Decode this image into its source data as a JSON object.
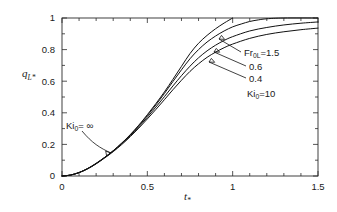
{
  "chart_data": {
    "type": "line",
    "title": "",
    "xlabel": "t*",
    "ylabel": "qL*",
    "xlim": [
      0,
      1.5
    ],
    "ylim": [
      0,
      1
    ],
    "grid": false,
    "legend_position": "inline-annotations",
    "x_ticks": [
      "0",
      "0.5",
      "1",
      "1.5"
    ],
    "x_tick_values": [
      0,
      0.5,
      1,
      1.5
    ],
    "x_minor_ticks": [
      0.1,
      0.2,
      0.3,
      0.4,
      0.6,
      0.7,
      0.8,
      0.9,
      1.1,
      1.2,
      1.3,
      1.4
    ],
    "y_ticks": [
      "0",
      "0.2",
      "0.4",
      "0.6",
      "0.8",
      "1"
    ],
    "y_tick_values": [
      0,
      0.2,
      0.4,
      0.6,
      0.8,
      1
    ],
    "y_minor_ticks": [
      0.1,
      0.3,
      0.5,
      0.7,
      0.9
    ],
    "series": [
      {
        "name": "Ki0=infinity",
        "label": "Ki",
        "label_sub": "0",
        "label_tail": "= ∞",
        "points": [
          [
            0.0,
            0.0
          ],
          [
            0.05,
            0.006
          ],
          [
            0.1,
            0.022
          ],
          [
            0.15,
            0.047
          ],
          [
            0.2,
            0.08
          ],
          [
            0.25,
            0.118
          ],
          [
            0.3,
            0.16
          ],
          [
            0.35,
            0.208
          ],
          [
            0.4,
            0.262
          ],
          [
            0.45,
            0.322
          ],
          [
            0.5,
            0.388
          ],
          [
            0.55,
            0.458
          ],
          [
            0.6,
            0.532
          ],
          [
            0.65,
            0.612
          ],
          [
            0.7,
            0.694
          ],
          [
            0.75,
            0.775
          ],
          [
            0.8,
            0.84
          ],
          [
            0.85,
            0.89
          ],
          [
            0.9,
            0.932
          ],
          [
            0.95,
            0.968
          ],
          [
            1.0,
            1.0
          ]
        ]
      },
      {
        "name": "Fr0L=1.5",
        "label": "Fr",
        "label_sub": "0L",
        "label_tail": "=1.5",
        "points": [
          [
            0.0,
            0.0
          ],
          [
            0.05,
            0.006
          ],
          [
            0.1,
            0.022
          ],
          [
            0.15,
            0.047
          ],
          [
            0.2,
            0.08
          ],
          [
            0.25,
            0.118
          ],
          [
            0.3,
            0.16
          ],
          [
            0.35,
            0.208
          ],
          [
            0.4,
            0.26
          ],
          [
            0.45,
            0.318
          ],
          [
            0.5,
            0.382
          ],
          [
            0.55,
            0.45
          ],
          [
            0.6,
            0.522
          ],
          [
            0.65,
            0.598
          ],
          [
            0.7,
            0.672
          ],
          [
            0.75,
            0.742
          ],
          [
            0.8,
            0.8
          ],
          [
            0.85,
            0.848
          ],
          [
            0.9,
            0.886
          ],
          [
            0.95,
            0.918
          ],
          [
            1.0,
            0.944
          ],
          [
            1.05,
            0.962
          ],
          [
            1.1,
            0.978
          ],
          [
            1.15,
            0.988
          ],
          [
            1.2,
            0.995
          ],
          [
            1.3,
            1.0
          ],
          [
            1.5,
            1.0
          ]
        ]
      },
      {
        "name": "0.6",
        "label": "0.6",
        "label_sub": "",
        "label_tail": "",
        "points": [
          [
            0.0,
            0.0
          ],
          [
            0.05,
            0.006
          ],
          [
            0.1,
            0.022
          ],
          [
            0.15,
            0.046
          ],
          [
            0.2,
            0.078
          ],
          [
            0.25,
            0.116
          ],
          [
            0.3,
            0.157
          ],
          [
            0.35,
            0.204
          ],
          [
            0.4,
            0.255
          ],
          [
            0.45,
            0.311
          ],
          [
            0.5,
            0.372
          ],
          [
            0.55,
            0.436
          ],
          [
            0.6,
            0.502
          ],
          [
            0.65,
            0.57
          ],
          [
            0.7,
            0.635
          ],
          [
            0.75,
            0.695
          ],
          [
            0.8,
            0.748
          ],
          [
            0.85,
            0.792
          ],
          [
            0.9,
            0.828
          ],
          [
            0.95,
            0.858
          ],
          [
            1.0,
            0.882
          ],
          [
            1.1,
            0.918
          ],
          [
            1.2,
            0.94
          ],
          [
            1.3,
            0.956
          ],
          [
            1.4,
            0.967
          ],
          [
            1.5,
            0.975
          ]
        ]
      },
      {
        "name": "0.4",
        "label": "0.4",
        "label_sub": "",
        "label_tail": "",
        "points": [
          [
            0.0,
            0.0
          ],
          [
            0.05,
            0.006
          ],
          [
            0.1,
            0.021
          ],
          [
            0.15,
            0.045
          ],
          [
            0.2,
            0.077
          ],
          [
            0.25,
            0.114
          ],
          [
            0.3,
            0.154
          ],
          [
            0.35,
            0.199
          ],
          [
            0.4,
            0.249
          ],
          [
            0.45,
            0.303
          ],
          [
            0.5,
            0.361
          ],
          [
            0.55,
            0.421
          ],
          [
            0.6,
            0.483
          ],
          [
            0.65,
            0.546
          ],
          [
            0.7,
            0.606
          ],
          [
            0.75,
            0.662
          ],
          [
            0.8,
            0.71
          ],
          [
            0.85,
            0.751
          ],
          [
            0.9,
            0.784
          ],
          [
            0.95,
            0.812
          ],
          [
            1.0,
            0.835
          ],
          [
            1.1,
            0.871
          ],
          [
            1.2,
            0.896
          ],
          [
            1.3,
            0.913
          ],
          [
            1.4,
            0.926
          ],
          [
            1.5,
            0.936
          ]
        ]
      }
    ],
    "annotations": [
      {
        "id": "fr0l",
        "text": "Fr",
        "sub": "0L",
        "tail": "=1.5",
        "x": 244,
        "y": 53
      },
      {
        "id": "v06",
        "text": "0.6",
        "sub": "",
        "tail": "",
        "x": 249,
        "y": 67
      },
      {
        "id": "v04",
        "text": "0.4",
        "sub": "",
        "tail": "",
        "x": 249,
        "y": 79
      },
      {
        "id": "ki10",
        "text": "Ki",
        "sub": "0",
        "tail": "=10",
        "x": 247,
        "y": 94
      },
      {
        "id": "kiinf",
        "text": "Ki",
        "sub": "0",
        "tail": "= ∞",
        "x": 66,
        "y": 126
      }
    ]
  },
  "axis": {
    "y_label_main": "q",
    "y_label_sub": "L*",
    "x_label_main": "t",
    "x_label_sub": "*"
  }
}
